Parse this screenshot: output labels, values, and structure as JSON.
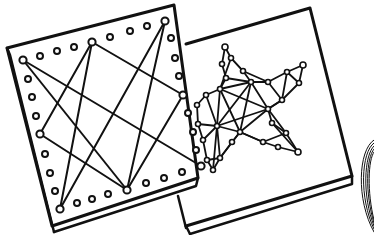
{
  "illustration": {
    "subject": "String art boards",
    "stroke_color": "#111111",
    "background_color": "#ffffff",
    "boards": [
      {
        "name": "square-pattern-board",
        "pattern": "eight-point star string pattern on pegboard with peg border"
      },
      {
        "name": "star-pattern-board",
        "pattern": "five-pointed star filled with web of strung pegs"
      }
    ],
    "accessory": "coil-of-thread"
  }
}
